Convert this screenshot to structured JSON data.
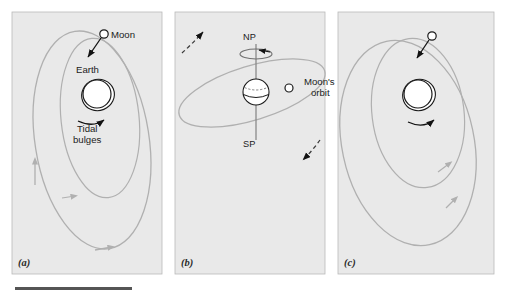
{
  "figure": {
    "title": "",
    "background_color": "#ffffff",
    "panel_fill": "#e9e9e9",
    "panel_border_color": "#b9b9b9",
    "orbit_color": "#b0b0b0",
    "ink_color": "#1a1a1a",
    "rule_color": "#555555",
    "width": 506,
    "height": 295
  },
  "panels": [
    {
      "id": "a",
      "label": "(a)",
      "label_x": 18,
      "label_y": 266,
      "box": {
        "x": 12,
        "y": 12,
        "w": 150,
        "h": 262
      },
      "labels": [
        {
          "name": "moon-label",
          "text": "Moon",
          "x": 111,
          "y": 38
        },
        {
          "name": "earth-label",
          "text": "Earth",
          "x": 76,
          "y": 73
        },
        {
          "name": "tidal-bulges-label-line1",
          "text": "Tidal",
          "x": 77,
          "y": 132
        },
        {
          "name": "tidal-bulges-label-line2",
          "text": "bulges",
          "x": 73,
          "y": 143
        }
      ],
      "earth": {
        "cx": 97,
        "cy": 94,
        "r": 14
      },
      "bulge": {
        "cx": 98,
        "cy": 95,
        "rx": 16.5,
        "ry": 15.5,
        "rotate": -22
      },
      "moon": {
        "cx": 104,
        "cy": 34,
        "r": 4.2
      }
    },
    {
      "id": "b",
      "label": "(b)",
      "label_x": 181,
      "label_y": 266,
      "box": {
        "x": 175,
        "y": 12,
        "w": 150,
        "h": 262
      },
      "labels": [
        {
          "name": "north-pole-label",
          "text": "NP",
          "x": 243,
          "y": 40
        },
        {
          "name": "south-pole-label",
          "text": "SP",
          "x": 243,
          "y": 147
        },
        {
          "name": "moons-orbit-label-line1",
          "text": "Moon's",
          "x": 304,
          "y": 85
        },
        {
          "name": "moons-orbit-label-line2",
          "text": "orbit",
          "x": 311,
          "y": 96
        }
      ],
      "earth": {
        "cx": 256,
        "cy": 92,
        "r": 13
      },
      "moon": {
        "cx": 289,
        "cy": 88,
        "r": 4.0
      }
    },
    {
      "id": "c",
      "label": "(c)",
      "label_x": 344,
      "label_y": 266,
      "box": {
        "x": 338,
        "y": 12,
        "w": 156,
        "h": 262
      },
      "labels": [],
      "earth": {
        "cx": 418,
        "cy": 94,
        "r": 14
      },
      "bulge": {
        "cx": 419,
        "cy": 95,
        "rx": 16.5,
        "ry": 15.5,
        "rotate": -22
      },
      "moon": {
        "cx": 432,
        "cy": 36,
        "r": 4.2
      }
    }
  ],
  "caption_rule": {
    "x": 15,
    "y": 287,
    "w": 117,
    "h": 3
  }
}
